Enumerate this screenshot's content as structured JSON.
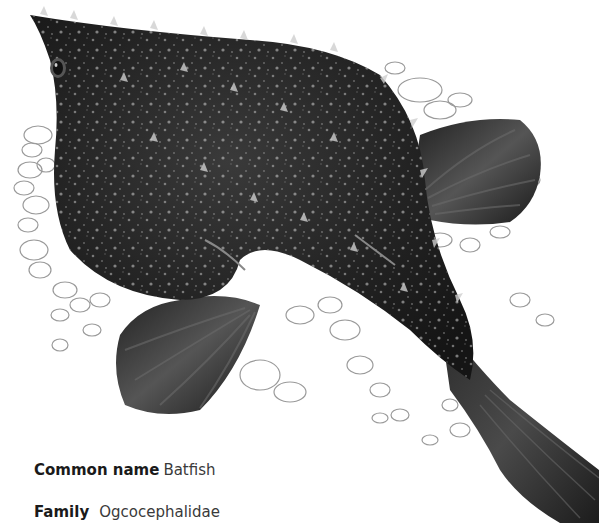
{
  "illustration": {
    "subject": "Batfish",
    "colors": {
      "body_dark": "#1c1c1c",
      "body_mid": "#3a3a3a",
      "fin": "#2e2e2e",
      "fin_ray_light": "#6a6a6a",
      "spine_highlight": "#cfcfcf",
      "pebble_outline": "#9a9a9a",
      "background": "#ffffff"
    }
  },
  "caption": {
    "common_name_label": "Common name",
    "common_name_value": "Batfish",
    "family_label": "Family",
    "family_value": "Ogcocephalidae"
  }
}
